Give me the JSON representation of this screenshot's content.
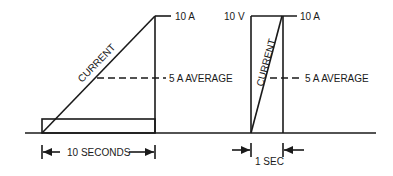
{
  "left_diagram": {
    "top_label": "10 A",
    "average_label": "5 A AVERAGE",
    "curve_label": "CURRENT",
    "duration_label": "10 SECONDS"
  },
  "right_diagram": {
    "voltage_label": "10 V",
    "top_label": "10 A",
    "average_label": "5 A AVERAGE",
    "curve_label": "CURRENT",
    "duration_label": "1 SEC"
  },
  "colors": {
    "ink": "#1a1a1a",
    "background": "#ffffff"
  }
}
